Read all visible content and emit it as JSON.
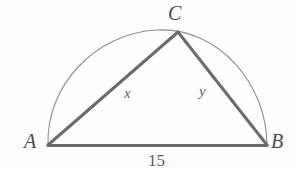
{
  "figure": {
    "type": "geometry-diagram",
    "background_color": "#fefefe",
    "stroke_color": "#6b6b6b",
    "arc_color": "#8e8e8e",
    "label_color": "#4a4a4a",
    "vertices": [
      {
        "id": "A",
        "label": "A",
        "x": 48,
        "y": 145
      },
      {
        "id": "B",
        "label": "B",
        "x": 267,
        "y": 145
      },
      {
        "id": "C",
        "label": "C",
        "x": 178,
        "y": 32
      }
    ],
    "segments": [
      {
        "id": "AC",
        "from": "A",
        "to": "C",
        "label": "x"
      },
      {
        "id": "CB",
        "from": "C",
        "to": "B",
        "label": "y"
      },
      {
        "id": "AB",
        "from": "A",
        "to": "B",
        "label": "15"
      }
    ],
    "arc": {
      "id": "semicircle-AB",
      "from": "A",
      "to": "B",
      "center_x": 157,
      "center_y": 145,
      "radius_x": 112,
      "radius_y": 115
    },
    "labels": {
      "vertex_a": "A",
      "vertex_b": "B",
      "vertex_c": "C",
      "side_ac": "x",
      "side_cb": "y",
      "side_ab": "15"
    }
  }
}
